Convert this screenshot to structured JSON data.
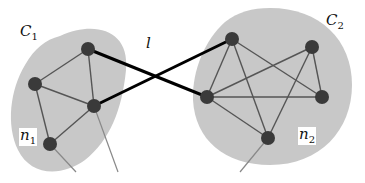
{
  "diagram": {
    "type": "network-communities",
    "colors": {
      "community_fill": "#c8c8c8",
      "node": "#3a3a3a",
      "intra_edge": "#555555",
      "external_edge": "#888888",
      "inter_link": "#000000"
    },
    "labels": {
      "c1": {
        "main": "C",
        "sub": "1"
      },
      "c2": {
        "main": "C",
        "sub": "2"
      },
      "n1": {
        "main": "n",
        "sub": "1"
      },
      "n2": {
        "main": "n",
        "sub": "2"
      },
      "link": "l"
    },
    "communities": [
      {
        "id": "C1",
        "nodes": [
          "A",
          "B",
          "C",
          "D"
        ]
      },
      {
        "id": "C2",
        "nodes": [
          "E",
          "F",
          "G",
          "H",
          "I"
        ]
      }
    ],
    "nodes": [
      {
        "id": "A",
        "x": 88,
        "y": 49
      },
      {
        "id": "B",
        "x": 35,
        "y": 84
      },
      {
        "id": "C",
        "x": 94,
        "y": 106
      },
      {
        "id": "D",
        "x": 50,
        "y": 144
      },
      {
        "id": "E",
        "x": 232,
        "y": 39
      },
      {
        "id": "F",
        "x": 312,
        "y": 47
      },
      {
        "id": "G",
        "x": 207,
        "y": 97
      },
      {
        "id": "H",
        "x": 322,
        "y": 97
      },
      {
        "id": "I",
        "x": 268,
        "y": 138
      }
    ],
    "intra_edges": [
      [
        "A",
        "B"
      ],
      [
        "A",
        "C"
      ],
      [
        "B",
        "C"
      ],
      [
        "B",
        "D"
      ],
      [
        "C",
        "D"
      ],
      [
        "E",
        "G"
      ],
      [
        "E",
        "H"
      ],
      [
        "E",
        "I"
      ],
      [
        "F",
        "G"
      ],
      [
        "F",
        "H"
      ],
      [
        "F",
        "I"
      ],
      [
        "G",
        "H"
      ],
      [
        "G",
        "I"
      ]
    ],
    "inter_links": [
      [
        "A",
        "G"
      ],
      [
        "C",
        "E"
      ]
    ],
    "external_edges": [
      {
        "from": "D",
        "to": [
          76,
          172
        ]
      },
      {
        "from": "C",
        "to": [
          118,
          172
        ]
      },
      {
        "from": "I",
        "to": [
          240,
          172
        ]
      }
    ]
  }
}
